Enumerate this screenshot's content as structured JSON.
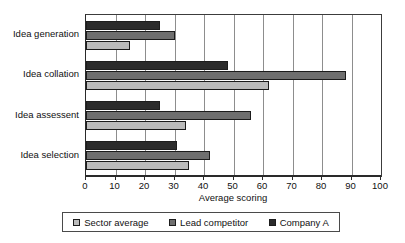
{
  "chart_data": {
    "type": "bar",
    "orientation": "horizontal",
    "title": "",
    "xlabel": "Average scoring",
    "ylabel": "",
    "xlim": [
      0,
      100
    ],
    "xticks": [
      0,
      10,
      20,
      30,
      40,
      50,
      60,
      70,
      80,
      90,
      100
    ],
    "grid": true,
    "legend_position": "bottom",
    "categories": [
      "Idea generation",
      "Idea collation",
      "Idea assessent",
      "Idea selection"
    ],
    "series": [
      {
        "name": "Sector average",
        "color": "#bcbcbc",
        "values": [
          15,
          62,
          34,
          35
        ]
      },
      {
        "name": "Lead competitor",
        "color": "#6f6f6f",
        "values": [
          30,
          88,
          56,
          42
        ]
      },
      {
        "name": "Company A",
        "color": "#2b2b2b",
        "values": [
          25,
          48,
          25,
          31
        ]
      }
    ]
  },
  "axis": {
    "x_title": "Average scoring",
    "tick_labels": [
      "0",
      "10",
      "20",
      "30",
      "40",
      "50",
      "60",
      "70",
      "80",
      "90",
      "100"
    ]
  },
  "legend": {
    "items": [
      {
        "label": "Sector average",
        "swatch": "s-sector"
      },
      {
        "label": "Lead competitor",
        "swatch": "s-lead"
      },
      {
        "label": "Company A",
        "swatch": "s-company"
      }
    ]
  }
}
